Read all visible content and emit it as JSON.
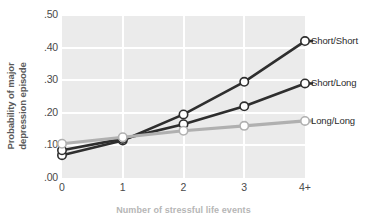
{
  "chart_data": {
    "type": "line",
    "title": "",
    "xlabel": "Number of stressful life events",
    "ylabel": "Probability of major\ndepression episode",
    "categories": [
      "0",
      "1",
      "2",
      "3",
      "4+"
    ],
    "ylim": [
      0.0,
      0.5
    ],
    "yticks": [
      ".00",
      ".10",
      ".20",
      ".30",
      ".40",
      ".50"
    ],
    "ytick_values": [
      0.0,
      0.1,
      0.2,
      0.3,
      0.4,
      0.5
    ],
    "grid": true,
    "legend_position": "right",
    "series": [
      {
        "name": "Short/Short",
        "color": "#2e2e2e",
        "values": [
          0.07,
          0.115,
          0.195,
          0.295,
          0.42
        ]
      },
      {
        "name": "Short/Long",
        "color": "#2e2e2e",
        "values": [
          0.085,
          0.12,
          0.165,
          0.22,
          0.29
        ]
      },
      {
        "name": "Long/Long",
        "color": "#b0b0b0",
        "values": [
          0.105,
          0.125,
          0.145,
          0.16,
          0.175
        ]
      }
    ],
    "marker": {
      "shape": "circle",
      "fill": "#ffffff",
      "radius": 4.2
    },
    "colors": {
      "plot_background": "#ebebeb",
      "gridline": "#ffffff",
      "tick_text": "#4a4a4a",
      "ylabel_text": "#5a5a5a",
      "xlabel_text": "#b6b6b6",
      "legend_text": "#2b2b2b"
    }
  },
  "legend": {
    "items": [
      {
        "label": "Short/Short"
      },
      {
        "label": "Short/Long"
      },
      {
        "label": "Long/Long"
      }
    ]
  },
  "axes": {
    "y_title": "Probability of major\ndepression episode",
    "x_title": "Number of stressful life events",
    "y_ticks": [
      {
        "label": ".50"
      },
      {
        "label": ".40"
      },
      {
        "label": ".30"
      },
      {
        "label": ".20"
      },
      {
        "label": ".10"
      },
      {
        "label": ".00"
      }
    ],
    "x_ticks": [
      {
        "label": "0"
      },
      {
        "label": "1"
      },
      {
        "label": "2"
      },
      {
        "label": "3"
      },
      {
        "label": "4+"
      }
    ]
  }
}
